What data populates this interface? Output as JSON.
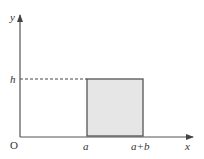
{
  "diagram": {
    "axes": {
      "x_label": "x",
      "y_label": "y",
      "origin_label": "O"
    },
    "x_ticks": [
      "a",
      "a+b"
    ],
    "y_ticks": [
      "h"
    ],
    "rectangle": {
      "x_start": "a",
      "x_end": "a+b",
      "height": "h",
      "fill_color": "#e6e6e6",
      "stroke_color": "#555555"
    },
    "guide_line": {
      "style": "dashed",
      "from": "y-axis",
      "to": "rectangle-top-left",
      "at": "h"
    },
    "colors": {
      "axis": "#555555",
      "text": "#333333"
    }
  }
}
